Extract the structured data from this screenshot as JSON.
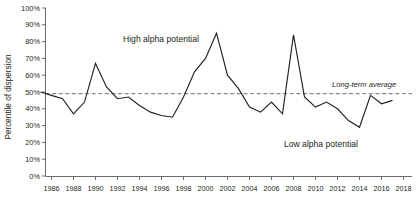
{
  "chart_data": {
    "type": "line",
    "title": "",
    "xlabel": "",
    "ylabel": "Percentile of dispersion",
    "xlim": [
      1985,
      2018
    ],
    "ylim": [
      0,
      100
    ],
    "grid": false,
    "legend": "none",
    "x": [
      1985,
      1986,
      1987,
      1988,
      1989,
      1990,
      1991,
      1992,
      1993,
      1994,
      1995,
      1996,
      1997,
      1998,
      1999,
      2000,
      2001,
      2002,
      2003,
      2004,
      2005,
      2006,
      2007,
      2008,
      2009,
      2010,
      2011,
      2012,
      2013,
      2014,
      2015,
      2016,
      2017
    ],
    "series": [
      {
        "name": "Percentile of dispersion",
        "values": [
          50,
          48,
          46,
          37,
          44,
          67,
          53,
          46,
          47,
          42,
          38,
          36,
          35,
          47,
          62,
          70,
          85,
          60,
          52,
          41,
          38,
          44,
          37,
          84,
          47,
          41,
          44,
          40,
          33,
          29,
          48,
          43,
          45
        ]
      }
    ],
    "reference_line": {
      "label": "Long-term average",
      "value": 49
    },
    "annotations": [
      {
        "text": "High alpha potential",
        "x": 1992.5,
        "y": 80
      },
      {
        "text": "Low alpha potential",
        "x": 2010.5,
        "y": 17
      }
    ],
    "ytick_labels": [
      "100%",
      "90%",
      "80%",
      "70%",
      "60%",
      "50%",
      "40%",
      "30%",
      "20%",
      "10%",
      "0%"
    ],
    "ytick_values": [
      100,
      90,
      80,
      70,
      60,
      50,
      40,
      30,
      20,
      10,
      0
    ],
    "xtick_labels": [
      "1986",
      "1988",
      "1990",
      "1992",
      "1994",
      "1996",
      "1998",
      "2000",
      "2002",
      "2004",
      "2006",
      "2008",
      "2010",
      "2012",
      "2014",
      "2016",
      "2018"
    ],
    "xtick_values": [
      1986,
      1988,
      1990,
      1992,
      1994,
      1996,
      1998,
      2000,
      2002,
      2004,
      2006,
      2008,
      2010,
      2012,
      2014,
      2016,
      2018
    ],
    "colors": {
      "series": "#231f20",
      "reference": "#6d6e71",
      "axis": "#58595b",
      "text": "#231f20",
      "background": "#ffffff"
    }
  }
}
